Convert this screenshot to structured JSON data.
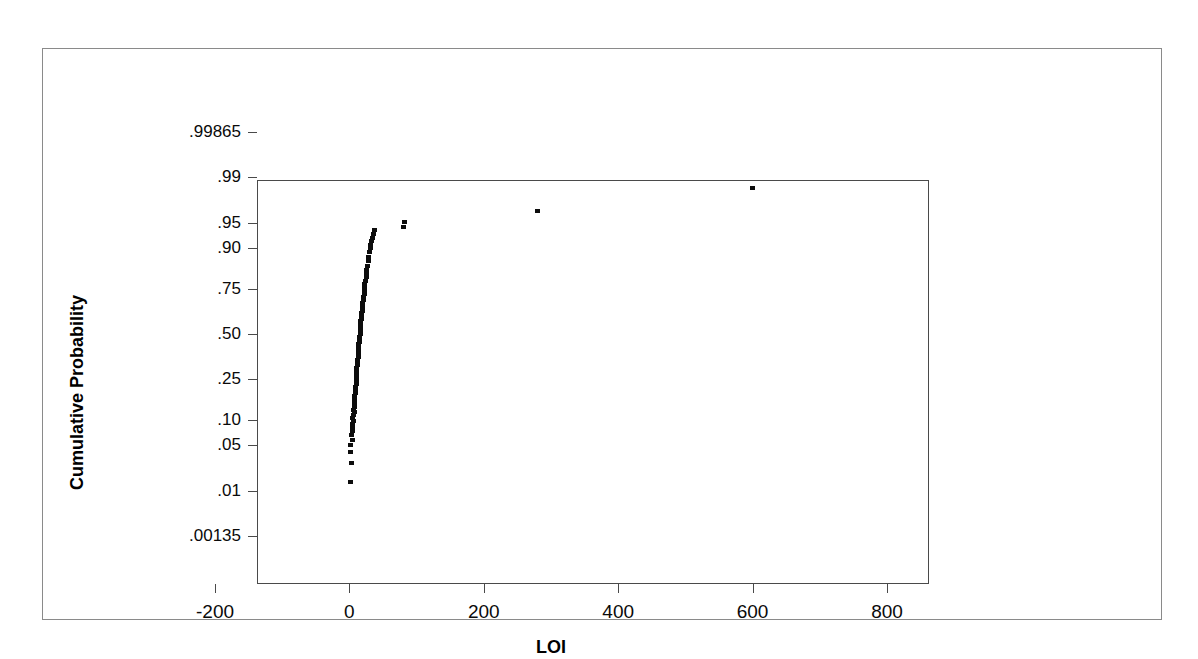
{
  "chart_data": {
    "type": "scatter",
    "title": "",
    "subtitle": "",
    "xlabel": "LOI",
    "ylabel": "Cumulative Probability",
    "plot_kind": "normal-probability-plot",
    "grid": false,
    "legend": null,
    "xlim": [
      -200,
      800
    ],
    "x_ticks": [
      -200,
      0,
      200,
      400,
      600,
      800
    ],
    "x_tick_labels": [
      "-200",
      "0",
      "200",
      "400",
      "600",
      "800"
    ],
    "ylim_probability": [
      0.00135,
      0.99865
    ],
    "y_ticks": [
      0.00135,
      0.01,
      0.05,
      0.1,
      0.25,
      0.5,
      0.75,
      0.9,
      0.95,
      0.99,
      0.99865
    ],
    "y_tick_labels": [
      ".00135",
      ".01",
      ".05",
      ".10",
      ".25",
      ".50",
      ".75",
      ".90",
      ".95",
      ".99",
      ".99865"
    ],
    "marker": "filled-square",
    "marker_color": "#0d0d0d",
    "series": [
      {
        "name": "LOI",
        "points": [
          {
            "x": 2,
            "p": 0.014
          },
          {
            "x": 3,
            "p": 0.028
          },
          {
            "x": 1,
            "p": 0.04
          },
          {
            "x": 2,
            "p": 0.05
          },
          {
            "x": 4,
            "p": 0.058
          },
          {
            "x": 3,
            "p": 0.066
          },
          {
            "x": 5,
            "p": 0.074
          },
          {
            "x": 4,
            "p": 0.082
          },
          {
            "x": 5,
            "p": 0.09
          },
          {
            "x": 6,
            "p": 0.098
          },
          {
            "x": 5,
            "p": 0.106
          },
          {
            "x": 6,
            "p": 0.114
          },
          {
            "x": 7,
            "p": 0.122
          },
          {
            "x": 6,
            "p": 0.13
          },
          {
            "x": 7,
            "p": 0.14
          },
          {
            "x": 8,
            "p": 0.15
          },
          {
            "x": 7,
            "p": 0.16
          },
          {
            "x": 8,
            "p": 0.17
          },
          {
            "x": 8,
            "p": 0.18
          },
          {
            "x": 9,
            "p": 0.19
          },
          {
            "x": 9,
            "p": 0.2
          },
          {
            "x": 9,
            "p": 0.215
          },
          {
            "x": 10,
            "p": 0.23
          },
          {
            "x": 10,
            "p": 0.245
          },
          {
            "x": 10,
            "p": 0.26
          },
          {
            "x": 11,
            "p": 0.275
          },
          {
            "x": 11,
            "p": 0.29
          },
          {
            "x": 11,
            "p": 0.305
          },
          {
            "x": 12,
            "p": 0.32
          },
          {
            "x": 12,
            "p": 0.335
          },
          {
            "x": 12,
            "p": 0.35
          },
          {
            "x": 13,
            "p": 0.365
          },
          {
            "x": 13,
            "p": 0.38
          },
          {
            "x": 13,
            "p": 0.395
          },
          {
            "x": 14,
            "p": 0.41
          },
          {
            "x": 14,
            "p": 0.425
          },
          {
            "x": 14,
            "p": 0.44
          },
          {
            "x": 15,
            "p": 0.455
          },
          {
            "x": 15,
            "p": 0.47
          },
          {
            "x": 15,
            "p": 0.485
          },
          {
            "x": 16,
            "p": 0.5
          },
          {
            "x": 16,
            "p": 0.515
          },
          {
            "x": 16,
            "p": 0.53
          },
          {
            "x": 17,
            "p": 0.545
          },
          {
            "x": 17,
            "p": 0.56
          },
          {
            "x": 17,
            "p": 0.575
          },
          {
            "x": 18,
            "p": 0.59
          },
          {
            "x": 18,
            "p": 0.605
          },
          {
            "x": 18,
            "p": 0.62
          },
          {
            "x": 19,
            "p": 0.635
          },
          {
            "x": 19,
            "p": 0.65
          },
          {
            "x": 20,
            "p": 0.665
          },
          {
            "x": 20,
            "p": 0.68
          },
          {
            "x": 21,
            "p": 0.695
          },
          {
            "x": 21,
            "p": 0.71
          },
          {
            "x": 22,
            "p": 0.725
          },
          {
            "x": 22,
            "p": 0.74
          },
          {
            "x": 23,
            "p": 0.755
          },
          {
            "x": 23,
            "p": 0.77
          },
          {
            "x": 24,
            "p": 0.785
          },
          {
            "x": 25,
            "p": 0.8
          },
          {
            "x": 25,
            "p": 0.815
          },
          {
            "x": 26,
            "p": 0.83
          },
          {
            "x": 27,
            "p": 0.845
          },
          {
            "x": 28,
            "p": 0.86
          },
          {
            "x": 29,
            "p": 0.875
          },
          {
            "x": 30,
            "p": 0.888
          },
          {
            "x": 31,
            "p": 0.898
          },
          {
            "x": 32,
            "p": 0.908
          },
          {
            "x": 33,
            "p": 0.916
          },
          {
            "x": 34,
            "p": 0.924
          },
          {
            "x": 36,
            "p": 0.932
          },
          {
            "x": 38,
            "p": 0.938
          },
          {
            "x": 80,
            "p": 0.944
          },
          {
            "x": 82,
            "p": 0.952
          },
          {
            "x": 280,
            "p": 0.966
          },
          {
            "x": 600,
            "p": 0.985
          }
        ]
      }
    ],
    "annotations": []
  },
  "figure": {
    "border_color": "#8a8a8a",
    "axis_color": "#4a4a4a",
    "background": "#ffffff"
  }
}
